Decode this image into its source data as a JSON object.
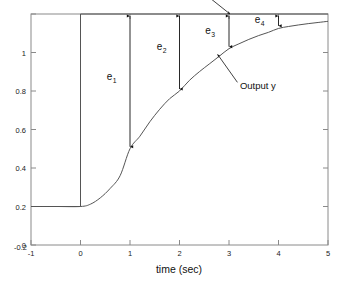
{
  "chart_data": {
    "type": "line",
    "title": "",
    "xlabel": "time (sec)",
    "ylabel": "",
    "xlim": [
      -1,
      5
    ],
    "ylim": [
      -0.2,
      1.0
    ],
    "xticks": [
      "-1",
      "0",
      "1",
      "2",
      "3",
      "4",
      "5"
    ],
    "xtick_values": [
      -1,
      0,
      1,
      2,
      3,
      4,
      5
    ],
    "yticks": [
      "-0.2",
      "0",
      "0.2",
      "0.4",
      "0.6",
      "0.8",
      "1"
    ],
    "ytick_values": [
      -0.2,
      0,
      0.2,
      0.4,
      0.6,
      0.8,
      1
    ],
    "grid": false,
    "legend": "none",
    "series": [
      {
        "name": "Setpoint r",
        "kind": "step",
        "color": "#555555",
        "x": [
          -1,
          0,
          0,
          5
        ],
        "values": [
          0,
          0,
          1,
          1
        ]
      },
      {
        "name": "Output y",
        "kind": "smooth",
        "color": "#555555",
        "x": [
          -1,
          -0.5,
          0,
          0.2,
          0.4,
          0.6,
          0.8,
          1.0,
          1.2,
          1.4,
          1.6,
          1.8,
          2.0,
          2.2,
          2.4,
          2.6,
          2.8,
          3.0,
          3.2,
          3.4,
          3.6,
          3.8,
          4.0,
          4.2,
          4.4,
          4.6,
          4.8,
          5.0
        ],
        "values": [
          0,
          0,
          0,
          0.012,
          0.045,
          0.094,
          0.16,
          0.3,
          0.365,
          0.44,
          0.505,
          0.56,
          0.6,
          0.655,
          0.7,
          0.74,
          0.78,
          0.82,
          0.845,
          0.868,
          0.888,
          0.905,
          0.925,
          0.935,
          0.943,
          0.95,
          0.956,
          0.962
        ]
      }
    ],
    "annotations": [
      {
        "id": "setpoint-annotation",
        "text": "Setpoint r",
        "text_x": 1.45,
        "text_y": 1.085,
        "arrow_from_x": 2.63,
        "arrow_from_y": 1.08,
        "arrow_to_x": 3.02,
        "arrow_to_y": 1.0
      },
      {
        "id": "output-annotation",
        "text": "Output y",
        "text_x": 3.22,
        "text_y": 0.612,
        "arrow_from_x": 3.17,
        "arrow_from_y": 0.645,
        "arrow_to_x": 2.77,
        "arrow_to_y": 0.79
      }
    ],
    "error_markers": [
      {
        "id": "e1",
        "label": "e",
        "subscript": "1",
        "x": 1,
        "top": 1.0,
        "bottom": 0.3,
        "label_x": 0.63,
        "label_y": 0.655
      },
      {
        "id": "e2",
        "label": "e",
        "subscript": "2",
        "x": 2,
        "top": 1.0,
        "bottom": 0.6,
        "label_x": 1.64,
        "label_y": 0.812
      },
      {
        "id": "e3",
        "label": "e",
        "subscript": "3",
        "x": 3,
        "top": 1.0,
        "bottom": 0.82,
        "label_x": 2.62,
        "label_y": 0.895
      },
      {
        "id": "e4",
        "label": "e",
        "subscript": "4",
        "x": 4,
        "top": 1.0,
        "bottom": 0.928,
        "label_x": 3.62,
        "label_y": 0.952
      }
    ]
  }
}
